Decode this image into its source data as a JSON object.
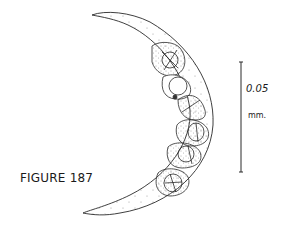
{
  "figure": {
    "label": "FIGURE 187",
    "colors": {
      "ink": "#2a2a2a",
      "background": "#ffffff"
    }
  },
  "scale_bar": {
    "value": "0.05",
    "unit": "mm."
  }
}
